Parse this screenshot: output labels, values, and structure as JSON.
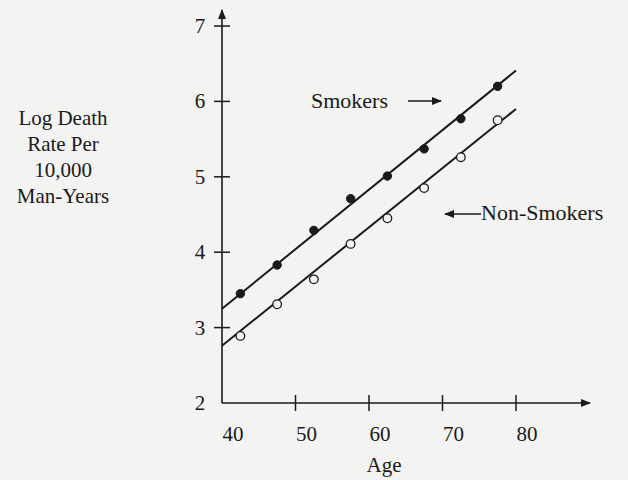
{
  "chart_data": {
    "type": "scatter",
    "title": "",
    "xlabel": "Age",
    "ylabel": "Log Death Rate Per 10,000 Man-Years",
    "ylabel_lines": [
      "Log Death",
      "Rate Per",
      "10,000",
      "Man-Years"
    ],
    "xlim": [
      40,
      87
    ],
    "ylim": [
      2,
      7.2
    ],
    "x_ticks": [
      40,
      50,
      60,
      70,
      80
    ],
    "y_ticks": [
      2,
      3,
      4,
      5,
      6,
      7
    ],
    "grid": false,
    "legend": "inline annotations with arrows",
    "series": [
      {
        "name": "Smokers",
        "marker": "filled-circle",
        "x": [
          42.5,
          47.5,
          52.5,
          57.5,
          62.5,
          67.5,
          72.5,
          77.5
        ],
        "values": [
          3.45,
          3.83,
          4.29,
          4.71,
          5.01,
          5.37,
          5.77,
          6.2
        ],
        "fit_line": {
          "x": [
            40,
            80
          ],
          "y": [
            3.25,
            6.41
          ]
        }
      },
      {
        "name": "Non-Smokers",
        "marker": "open-circle",
        "x": [
          42.5,
          47.5,
          52.5,
          57.5,
          62.5,
          67.5,
          72.5,
          77.5
        ],
        "values": [
          2.89,
          3.31,
          3.64,
          4.11,
          4.45,
          4.85,
          5.26,
          5.75
        ],
        "fit_line": {
          "x": [
            40,
            80
          ],
          "y": [
            2.76,
            5.9
          ]
        }
      }
    ],
    "annotations": [
      {
        "text": "Smokers",
        "arrow": "right",
        "points_to": "Smokers"
      },
      {
        "text": "Non-Smokers",
        "arrow": "left",
        "points_to": "Non-Smokers"
      }
    ]
  },
  "labels": {
    "smokers": "Smokers",
    "non_smokers": "Non-Smokers",
    "x_axis_title": "Age"
  },
  "colors": {
    "ink": "#1a1a1a",
    "background": "#f3f3f1"
  }
}
